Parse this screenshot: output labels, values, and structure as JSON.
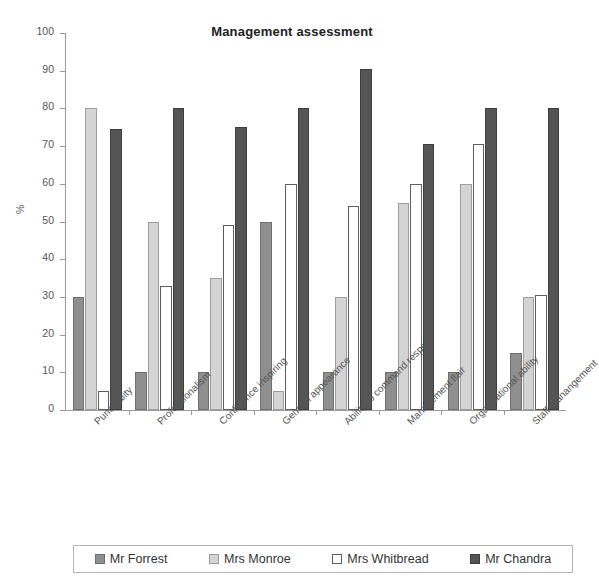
{
  "chart_data": {
    "type": "bar",
    "title": "Management assessment",
    "xlabel": "",
    "ylabel": "%",
    "ylim": [
      0,
      100
    ],
    "ytick_step": 10,
    "yticks": [
      0,
      10,
      20,
      30,
      40,
      50,
      60,
      70,
      80,
      90,
      100
    ],
    "grid": false,
    "legend_position": "bottom",
    "categories": [
      "Punctuality",
      "Professionalism",
      "Confidence inspiring",
      "General appearance",
      "Ability to command respect",
      "Management flair",
      "Organisational ability",
      "Staff manangement"
    ],
    "series": [
      {
        "name": "Mr Forrest",
        "color": "#8f8f8f",
        "values": [
          30,
          10,
          10,
          50,
          10,
          10,
          10,
          15
        ]
      },
      {
        "name": "Mrs Monroe",
        "color": "#d4d4d4",
        "values": [
          80,
          50,
          35,
          5,
          30,
          55,
          60,
          30
        ]
      },
      {
        "name": "Mrs Whitbread",
        "color": "#ffffff",
        "values": [
          5,
          33,
          49,
          60,
          54,
          60,
          70.5,
          30.5
        ]
      },
      {
        "name": "Mr Chandra",
        "color": "#555555",
        "values": [
          74.5,
          80,
          75,
          80,
          90.5,
          70.5,
          80,
          80
        ]
      }
    ]
  },
  "legend": {
    "items": [
      {
        "label": "Mr Forrest",
        "swatch": "forrest"
      },
      {
        "label": "Mrs Monroe",
        "swatch": "monroe"
      },
      {
        "label": "Mrs Whitbread",
        "swatch": "whitbread"
      },
      {
        "label": "Mr Chandra",
        "swatch": "chandra"
      }
    ]
  }
}
